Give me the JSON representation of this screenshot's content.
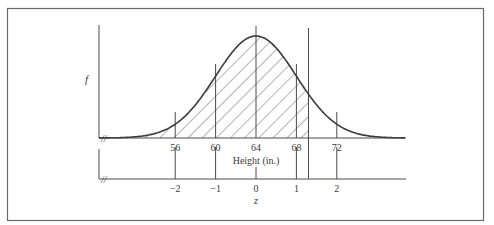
{
  "chart_data": {
    "type": "area",
    "title": "",
    "ylabel": "f",
    "xlabel": "Height (in.)",
    "x2label": "z",
    "mean": 64,
    "sd": 4,
    "x_ticks": [
      56,
      60,
      64,
      68,
      72
    ],
    "x_tick_labels": [
      "56",
      "60",
      "64",
      "68",
      "72"
    ],
    "z_ticks": [
      -2,
      -1,
      0,
      1,
      2
    ],
    "z_tick_labels": [
      "−2",
      "−1",
      "0",
      "1",
      "2"
    ],
    "shaded_region": {
      "from": "-inf",
      "to_height": 69.2,
      "to_z": 1.3,
      "pattern": "diagonal hatching"
    },
    "axis_break_symbol": "//",
    "grid": false,
    "legend": null,
    "colors": {
      "curve": "#3a3a3a",
      "axes": "#4a4a4a",
      "hatch": "#5a5a5a",
      "frame": "#6a6a6a"
    }
  },
  "labels": {
    "y_axis": "f",
    "x_axis": "Height (in.)",
    "z_axis": "z",
    "break": "//"
  }
}
